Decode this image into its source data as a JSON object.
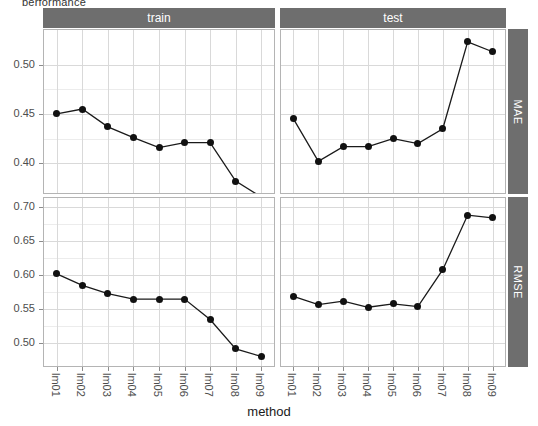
{
  "top_clipped_text": "performance",
  "chart_data": {
    "type": "line",
    "title": "",
    "xlabel": "method",
    "ylabel": "",
    "categories": [
      "lm01",
      "lm02",
      "lm03",
      "lm04",
      "lm05",
      "lm06",
      "lm07",
      "lm08",
      "lm09"
    ],
    "grid": true,
    "legend": "none",
    "facet_cols": [
      "train",
      "test"
    ],
    "facet_rows": [
      "MAE",
      "RMSE"
    ],
    "panels": [
      {
        "row": "MAE",
        "col": "train",
        "ylim": [
          0.37,
          0.535
        ],
        "yticks": [
          0.4,
          0.45,
          0.5
        ],
        "ytick_labels": [
          "0.40",
          "0.45",
          "0.50"
        ],
        "values": [
          0.45,
          0.455,
          0.437,
          0.426,
          0.416,
          0.421,
          0.421,
          0.382,
          0.366
        ]
      },
      {
        "row": "MAE",
        "col": "test",
        "ylim": [
          0.37,
          0.535
        ],
        "yticks": [
          0.4,
          0.45,
          0.5
        ],
        "ytick_labels": [
          "0.40",
          "0.45",
          "0.50"
        ],
        "values": [
          0.445,
          0.402,
          0.417,
          0.417,
          0.425,
          0.42,
          0.435,
          0.523,
          0.513
        ]
      },
      {
        "row": "RMSE",
        "col": "train",
        "ylim": [
          0.467,
          0.713
        ],
        "yticks": [
          0.5,
          0.55,
          0.6,
          0.65,
          0.7
        ],
        "ytick_labels": [
          "0.50",
          "0.55",
          "0.60",
          "0.65",
          "0.70"
        ],
        "values": [
          0.602,
          0.585,
          0.573,
          0.565,
          0.565,
          0.565,
          0.535,
          0.492,
          0.481
        ]
      },
      {
        "row": "RMSE",
        "col": "test",
        "ylim": [
          0.467,
          0.713
        ],
        "yticks": [
          0.5,
          0.55,
          0.6,
          0.65,
          0.7
        ],
        "ytick_labels": [
          "0.50",
          "0.55",
          "0.60",
          "0.65",
          "0.70"
        ],
        "values": [
          0.569,
          0.557,
          0.562,
          0.553,
          0.558,
          0.554,
          0.608,
          0.688,
          0.684
        ]
      }
    ],
    "colors": {
      "point": "#111111",
      "line": "#1a1a1a",
      "strip": "#6e6e6e",
      "grid": "#d9d9d9",
      "panel_border": "#b4b4b4"
    }
  }
}
